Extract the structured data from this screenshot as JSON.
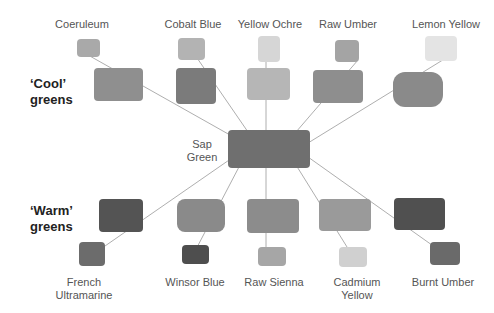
{
  "center": {
    "label_line1": "Sap",
    "label_line2": "Green",
    "color": "#6f6f6f"
  },
  "groups": {
    "cool": {
      "line1": "‘Cool’",
      "line2": "greens"
    },
    "warm": {
      "line1": "‘Warm’",
      "line2": "greens"
    }
  },
  "top": [
    {
      "name": "Coeruleum",
      "pigment_color": "#a9a9a9",
      "mix_color": "#8f8f8f"
    },
    {
      "name": "Cobalt Blue",
      "pigment_color": "#b3b3b3",
      "mix_color": "#7b7b7b"
    },
    {
      "name": "Yellow Ochre",
      "pigment_color": "#d6d6d6",
      "mix_color": "#b6b6b6"
    },
    {
      "name": "Raw Umber",
      "pigment_color": "#a4a4a4",
      "mix_color": "#8e8e8e"
    },
    {
      "name": "Lemon Yellow",
      "pigment_color": "#e4e4e4",
      "mix_color": "#8a8a8a"
    }
  ],
  "bottom": [
    {
      "name_line1": "French",
      "name_line2": "Ultramarine",
      "pigment_color": "#6c6c6c",
      "mix_color": "#545454"
    },
    {
      "name_line1": "Winsor Blue",
      "name_line2": "",
      "pigment_color": "#4e4e4e",
      "mix_color": "#8a8a8a"
    },
    {
      "name_line1": "Raw Sienna",
      "name_line2": "",
      "pigment_color": "#a6a6a6",
      "mix_color": "#8c8c8c"
    },
    {
      "name_line1": "Cadmium",
      "name_line2": "Yellow",
      "pigment_color": "#d0d0d0",
      "mix_color": "#9a9a9a"
    },
    {
      "name_line1": "Burnt Umber",
      "name_line2": "",
      "pigment_color": "#6a6a6a",
      "mix_color": "#505050"
    }
  ]
}
